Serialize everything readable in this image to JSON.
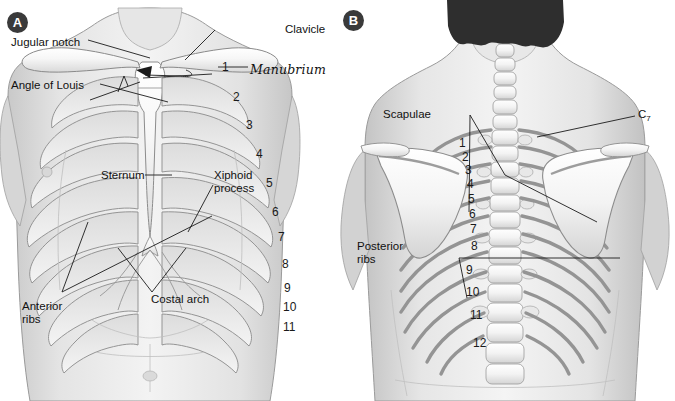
{
  "figure": {
    "background_color": "#ffffff",
    "ink_color": "#1b1b1b"
  },
  "panels": [
    {
      "marker": "A",
      "view": "anterior-chest",
      "labels": [
        {
          "name": "jugular-notch",
          "text": "Jugular notch"
        },
        {
          "name": "clavicle",
          "text": "Clavicle"
        },
        {
          "name": "angle-of-louis",
          "text": "Angle of Louis"
        },
        {
          "name": "manubrium",
          "text": "Manubrium",
          "style": "handwritten"
        },
        {
          "name": "sternum",
          "text": "Sternum"
        },
        {
          "name": "xiphoid-process",
          "text": "Xiphoid process"
        },
        {
          "name": "costal-arch",
          "text": "Costal arch"
        },
        {
          "name": "anterior-ribs",
          "text": "Anterior ribs"
        }
      ],
      "rib_numbers": [
        "1",
        "2",
        "3",
        "4",
        "5",
        "6",
        "7",
        "8",
        "9",
        "10",
        "11"
      ]
    },
    {
      "marker": "B",
      "view": "posterior-back",
      "labels": [
        {
          "name": "scapulae",
          "text": "Scapulae"
        },
        {
          "name": "c7-vertebra",
          "text": "C",
          "subscript": "7"
        },
        {
          "name": "posterior-ribs",
          "text": "Posterior ribs"
        }
      ],
      "rib_numbers": [
        "1",
        "2",
        "3",
        "4",
        "5",
        "6",
        "7",
        "8",
        "9",
        "10",
        "11",
        "12"
      ]
    }
  ],
  "colors": {
    "marker_fill": "#3a3a3a",
    "marker_text": "#ffffff",
    "bone": "#f2f2f2",
    "skin_light": "#e9e9e9",
    "skin_mid": "#d2d2d2",
    "skin_dark": "#b4b4b4",
    "hair": "#2e2e2e",
    "outline": "#8d8d8d"
  }
}
